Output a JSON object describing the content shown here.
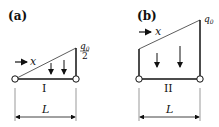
{
  "panels": [
    {
      "label": "(a)",
      "load_label_num": "q",
      "load_label_sub": "0",
      "load_label_den": "2",
      "axis_label": "x",
      "beam_label": "I",
      "length_label": "L",
      "load_shape": "triangle"
    },
    {
      "label": "(b)",
      "load_label_num": "q",
      "load_label_sub": "0",
      "axis_label": "x",
      "beam_label": "II",
      "length_label": "L",
      "load_shape": "trapezoid"
    }
  ]
}
